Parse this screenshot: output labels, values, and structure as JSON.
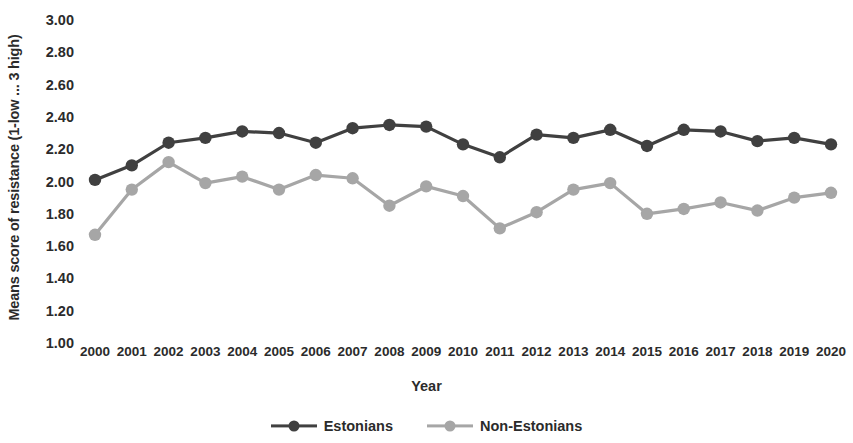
{
  "chart_data": {
    "type": "line",
    "title": "",
    "xlabel": "Year",
    "ylabel": "Means score of resistance (1-low ... 3 high)",
    "categories": [
      "2000",
      "2001",
      "2002",
      "2003",
      "2004",
      "2005",
      "2006",
      "2007",
      "2008",
      "2009",
      "2010",
      "2011",
      "2012",
      "2013",
      "2014",
      "2015",
      "2016",
      "2017",
      "2018",
      "2019",
      "2020"
    ],
    "x": [
      2000,
      2001,
      2002,
      2003,
      2004,
      2005,
      2006,
      2007,
      2008,
      2009,
      2010,
      2011,
      2012,
      2013,
      2014,
      2015,
      2016,
      2017,
      2018,
      2019,
      2020
    ],
    "ylim": [
      1.0,
      3.0
    ],
    "ytick_labels": [
      "3.00",
      "2.80",
      "2.60",
      "2.40",
      "2.20",
      "2.00",
      "1.80",
      "1.60",
      "1.40",
      "1.20",
      "1.00"
    ],
    "ytick_values": [
      3.0,
      2.8,
      2.6,
      2.4,
      2.2,
      2.0,
      1.8,
      1.6,
      1.4,
      1.2,
      1.0
    ],
    "grid": false,
    "legend_position": "bottom-center",
    "series": [
      {
        "name": "Estonians",
        "color": "#404040",
        "values": [
          2.01,
          2.1,
          2.24,
          2.27,
          2.31,
          2.3,
          2.24,
          2.33,
          2.35,
          2.34,
          2.23,
          2.15,
          2.29,
          2.27,
          2.32,
          2.22,
          2.32,
          2.31,
          2.25,
          2.27,
          2.23
        ]
      },
      {
        "name": "Non-Estonians",
        "color": "#a6a6a6",
        "values": [
          1.67,
          1.95,
          2.12,
          1.99,
          2.03,
          1.95,
          2.04,
          2.02,
          1.85,
          1.97,
          1.91,
          1.71,
          1.81,
          1.95,
          1.99,
          1.8,
          1.83,
          1.87,
          1.82,
          1.9,
          1.93
        ]
      }
    ]
  },
  "axes": {
    "y_title": "Means score of resistance (1-low ... 3 high)",
    "x_title": "Year"
  },
  "legend": {
    "items": [
      {
        "label": "Estonians",
        "color": "#404040"
      },
      {
        "label": "Non-Estonians",
        "color": "#a6a6a6"
      }
    ]
  }
}
